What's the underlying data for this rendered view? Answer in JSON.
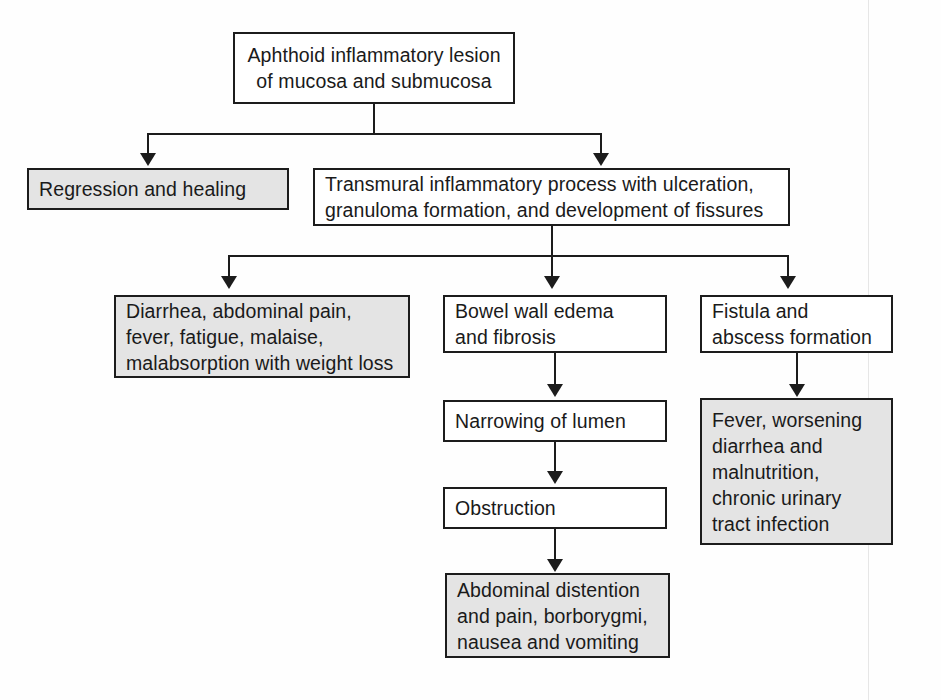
{
  "diagram": {
    "type": "flowchart",
    "orientation": "top-down",
    "colors": {
      "stroke": "#1c1c1c",
      "shaded_fill": "#e4e4e4",
      "plain_fill": "#ffffff",
      "text": "#1a1a1a",
      "page_background": "#fefefe"
    },
    "nodes": [
      {
        "id": "aphthoid",
        "text": "Aphthoid inflammatory lesion\nof mucosa and submucosa",
        "fill": "plain",
        "align": "center"
      },
      {
        "id": "regression",
        "text": "Regression and healing",
        "fill": "shaded",
        "align": "left"
      },
      {
        "id": "transmural",
        "text": "Transmural inflammatory process with ulceration,\ngranuloma formation, and development of fissures",
        "fill": "plain",
        "align": "left"
      },
      {
        "id": "symptoms-general",
        "text": "Diarrhea, abdominal pain,\nfever, fatigue, malaise,\nmalabsorption with weight loss",
        "fill": "shaded",
        "align": "left"
      },
      {
        "id": "bowel-wall-edema",
        "text": "Bowel wall edema\nand fibrosis",
        "fill": "plain",
        "align": "left"
      },
      {
        "id": "fistula",
        "text": "Fistula and\nabscess formation",
        "fill": "plain",
        "align": "left"
      },
      {
        "id": "narrowing",
        "text": "Narrowing of lumen",
        "fill": "plain",
        "align": "left"
      },
      {
        "id": "fistula-symptoms",
        "text": "Fever, worsening\ndiarrhea and\nmalnutrition,\nchronic urinary\ntract infection",
        "fill": "shaded",
        "align": "left"
      },
      {
        "id": "obstruction",
        "text": "Obstruction",
        "fill": "plain",
        "align": "left"
      },
      {
        "id": "obstruction-symptoms",
        "text": "Abdominal distention\nand pain, borborygmi,\nnausea and vomiting",
        "fill": "shaded",
        "align": "left"
      }
    ],
    "edges": [
      {
        "from": "aphthoid",
        "to": "regression"
      },
      {
        "from": "aphthoid",
        "to": "transmural"
      },
      {
        "from": "transmural",
        "to": "symptoms-general"
      },
      {
        "from": "transmural",
        "to": "bowel-wall-edema"
      },
      {
        "from": "transmural",
        "to": "fistula"
      },
      {
        "from": "bowel-wall-edema",
        "to": "narrowing"
      },
      {
        "from": "narrowing",
        "to": "obstruction"
      },
      {
        "from": "obstruction",
        "to": "obstruction-symptoms"
      },
      {
        "from": "fistula",
        "to": "fistula-symptoms"
      }
    ]
  }
}
